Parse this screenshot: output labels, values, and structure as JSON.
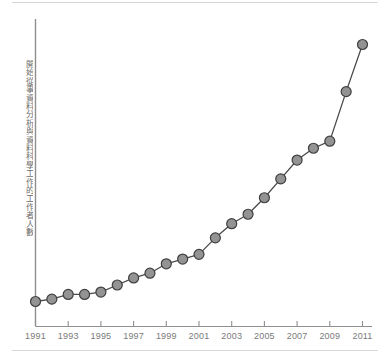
{
  "figure": {
    "background_color": "#ffffff",
    "rule_color": "#d8d8d8",
    "axis_color": "#8f8f8f",
    "line_color": "#4a4a4a",
    "marker_fill": "#939393",
    "marker_stroke": "#3f3f3f",
    "tick_label_color": "#7a7a7a",
    "ylabel_color": "#6d6d6d"
  },
  "chart_data": {
    "type": "line",
    "title": "",
    "subtitle": "",
    "xlabel": "",
    "ylabel": "開始從事資料分析與資料科學工作的工作者人數",
    "legend": [],
    "legend_position": "none",
    "grid": false,
    "x": [
      1991,
      1992,
      1993,
      1994,
      1995,
      1996,
      1997,
      1998,
      1999,
      2000,
      2001,
      2002,
      2003,
      2004,
      2005,
      2006,
      2007,
      2008,
      2009,
      2010,
      2011
    ],
    "values": [
      3,
      4,
      6,
      6,
      7,
      10,
      13,
      15,
      19,
      21,
      23,
      30,
      36,
      40,
      47,
      55,
      63,
      68,
      71,
      92,
      112
    ],
    "xlim": [
      1991,
      2011
    ],
    "ylim": [
      0,
      120
    ],
    "x_tick_values": [
      1991,
      1992,
      1993,
      1994,
      1995,
      1996,
      1997,
      1998,
      1999,
      2000,
      2001,
      2002,
      2003,
      2004,
      2005,
      2006,
      2007,
      2008,
      2009,
      2010,
      2011
    ],
    "x_tick_labels": [
      "1991",
      "",
      "1993",
      "",
      "1995",
      "",
      "1997",
      "",
      "1999",
      "",
      "2001",
      "",
      "2003",
      "",
      "2005",
      "",
      "2007",
      "",
      "2009",
      "",
      "2011"
    ],
    "x_labeled_ticks": [
      "1991",
      "1993",
      "1995",
      "1997",
      "1999",
      "2001",
      "2003",
      "2005",
      "2007",
      "2009",
      "2011"
    ],
    "y_tick_labels": [],
    "annotations": [],
    "marker": "circle",
    "marker_size": 5
  }
}
